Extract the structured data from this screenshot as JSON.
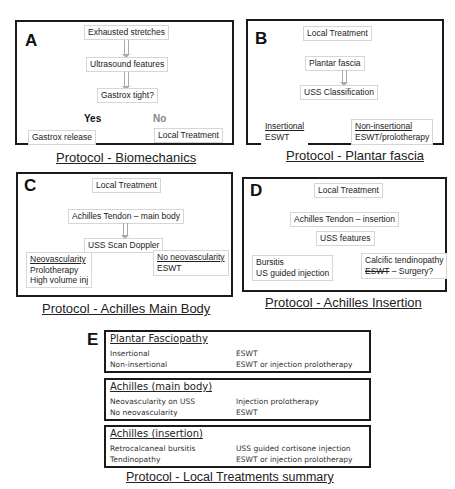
{
  "panels": {
    "A": {
      "letter": "A",
      "nodes": [
        "Exhausted stretches",
        "Ultrasound features",
        "Gastrox tight?"
      ],
      "yes": "Yes",
      "no": "No",
      "yes_outcome": "Gastrox release",
      "no_outcome": "Local Treatment",
      "caption": "Protocol  - Biomechanics"
    },
    "B": {
      "letter": "B",
      "nodes": [
        "Local Treatment",
        "Plantar fascia",
        "USS Classification"
      ],
      "left": {
        "title": "Insertional",
        "line": "ESWT"
      },
      "right": {
        "title": "Non-insertional",
        "line": "ESWT/prolotherapy"
      },
      "caption": "Protocol  - Plantar fascia"
    },
    "C": {
      "letter": "C",
      "nodes": [
        "Local Treatment",
        "Achilles Tendon – main body",
        "USS Scan Doppler"
      ],
      "left": {
        "title": "Neovascularity",
        "lines": [
          "Prolotherapy",
          "High volume inj"
        ]
      },
      "right": {
        "title": "No neovascularity",
        "lines": [
          "ESWT"
        ]
      },
      "caption": "Protocol  - Achilles Main Body"
    },
    "D": {
      "letter": "D",
      "nodes": [
        "Local Treatment",
        "Achilles Tendon – insertion",
        "USS features"
      ],
      "left": {
        "lines": [
          "Bursitis",
          "US guided injection"
        ]
      },
      "right": {
        "line1": "Calcific tendinopathy",
        "strike": "ESWT",
        "rest": " – Surgery?"
      },
      "caption": "Protocol  - Achilles Insertion"
    },
    "E": {
      "letter": "E",
      "sections": [
        {
          "title": "Plantar Fasciopathy",
          "rows": [
            [
              "Insertional",
              "ESWT"
            ],
            [
              "Non-insertional",
              "ESWT or injection prolotherapy"
            ]
          ]
        },
        {
          "title": "Achilles (main body)",
          "rows": [
            [
              "Neovascularity on USS",
              "Injection prolotherapy"
            ],
            [
              "No neovascularity",
              "ESWT"
            ]
          ]
        },
        {
          "title": "Achilles (insertion)",
          "rows": [
            [
              "Retrocalcaneal bursitis",
              "USS guided cortisone injection"
            ],
            [
              "Tendinopathy",
              "ESWT or injection prolotherapy"
            ]
          ]
        }
      ],
      "caption": "Protocol  - Local Treatments summary"
    }
  }
}
